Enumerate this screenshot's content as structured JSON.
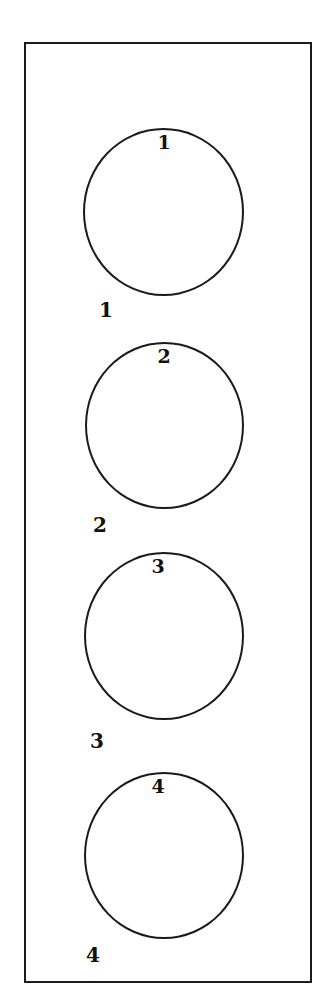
{
  "figure": {
    "frame_color": "#1a1a1a",
    "items": [
      {
        "id": 1,
        "inner_label": "1",
        "outer_label": "1"
      },
      {
        "id": 2,
        "inner_label": "2",
        "outer_label": "2"
      },
      {
        "id": 3,
        "inner_label": "3",
        "outer_label": "3"
      },
      {
        "id": 4,
        "inner_label": "4",
        "outer_label": "4"
      }
    ]
  }
}
